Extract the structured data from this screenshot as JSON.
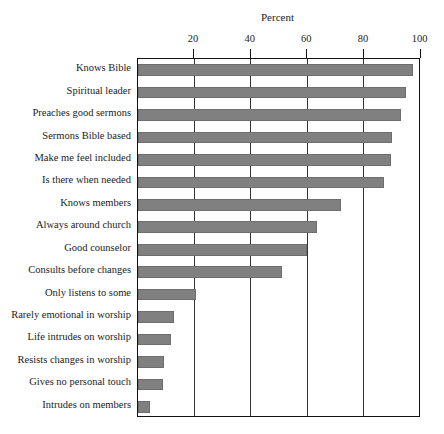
{
  "chart_data": {
    "type": "bar",
    "orientation": "horizontal",
    "title": "Percent",
    "xlabel": "Percent",
    "ylabel": "",
    "xlim": [
      0,
      100
    ],
    "xticks": [
      20,
      40,
      60,
      80,
      100
    ],
    "grid": true,
    "legend": null,
    "bar_color": "#808080",
    "categories": [
      "Knows Bible",
      "Spiritual leader",
      "Preaches good sermons",
      "Sermons Bible based",
      "Make me feel included",
      "Is there when needed",
      "Knows members",
      "Always around church",
      "Good counselor",
      "Consults before changes",
      "Only listens to some",
      "Rarely emotional in worship",
      "Life intrudes on worship",
      "Resists changes in worship",
      "Gives no personal touch",
      "Intrudes on members"
    ],
    "values": [
      97.5,
      95,
      93,
      90,
      89.5,
      87,
      72,
      63.5,
      60,
      51,
      20.5,
      13,
      12,
      9.5,
      9,
      4.5
    ]
  }
}
